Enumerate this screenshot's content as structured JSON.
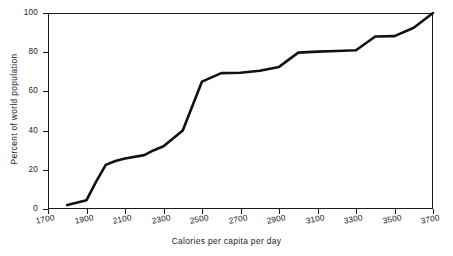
{
  "chart_data": {
    "type": "line",
    "title": "",
    "xlabel": "Calories per capita per day",
    "ylabel": "Percent of world population",
    "xlim": [
      1700,
      3700
    ],
    "ylim": [
      0,
      100
    ],
    "xticks": [
      1700,
      1900,
      2100,
      2300,
      2500,
      2700,
      2900,
      3100,
      3300,
      3500,
      3700
    ],
    "yticks": [
      0,
      20,
      40,
      60,
      80,
      100
    ],
    "grid": false,
    "legend": null,
    "line_color": "#111111",
    "line_width": 2.6,
    "series": [
      {
        "name": "Cumulative world population",
        "x": [
          1800,
          1900,
          1950,
          2000,
          2050,
          2100,
          2200,
          2250,
          2300,
          2400,
          2500,
          2600,
          2700,
          2800,
          2900,
          3000,
          3100,
          3200,
          3300,
          3400,
          3500,
          3600,
          3700
        ],
        "y": [
          2,
          4.5,
          14,
          22.5,
          24.5,
          25.8,
          27.5,
          30,
          32,
          40,
          65,
          69.3,
          69.5,
          70.5,
          72.5,
          79.8,
          80.3,
          80.6,
          81,
          88,
          88.2,
          92.5,
          100
        ]
      }
    ]
  },
  "axes": {
    "x_tick_labels": [
      "1700",
      "1900",
      "2100",
      "2300",
      "2500",
      "2700",
      "2900",
      "3100",
      "3300",
      "3500",
      "3700"
    ],
    "y_tick_labels": [
      "0",
      "20",
      "40",
      "60",
      "80",
      "100"
    ]
  }
}
